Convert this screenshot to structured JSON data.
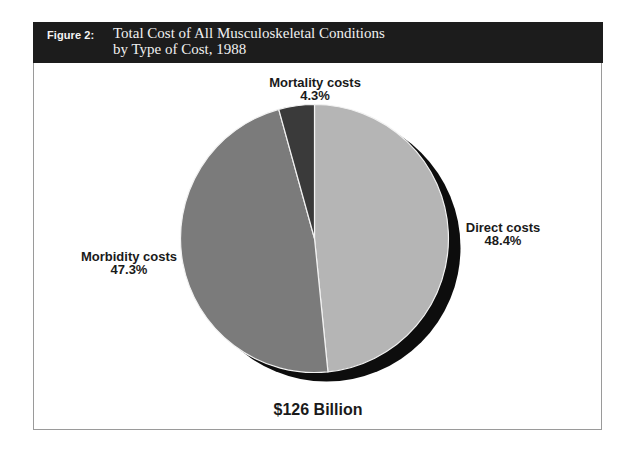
{
  "figure": {
    "label": "Figure 2:",
    "title_line1": "Total Cost of All Musculoskeletal Conditions",
    "title_line2": "by Type of Cost, 1988"
  },
  "total_label": "$126 Billion",
  "labels": {
    "direct": {
      "name": "Direct costs",
      "pct": "48.4%"
    },
    "morbidity": {
      "name": "Morbidity costs",
      "pct": "47.3%"
    },
    "mortality": {
      "name": "Mortality costs",
      "pct": "4.3%"
    }
  },
  "colors": {
    "header_bg": "#1c1c1c",
    "direct": "#b5b5b5",
    "morbidity": "#7b7b7b",
    "mortality": "#3a3a3a",
    "shadow": "#0d0d0d",
    "divider": "#f2f2f2"
  },
  "chart_data": {
    "type": "pie",
    "title": "Total Cost of All Musculoskeletal Conditions by Type of Cost, 1988",
    "figure_label": "Figure 2:",
    "categories": [
      "Direct costs",
      "Morbidity costs",
      "Mortality costs"
    ],
    "values": [
      48.4,
      47.3,
      4.3
    ],
    "unit": "%",
    "total": "$126 Billion",
    "start_angle_deg": 0,
    "direction": "clockwise",
    "drop_shadow": true,
    "legend": "none (direct labels)"
  }
}
